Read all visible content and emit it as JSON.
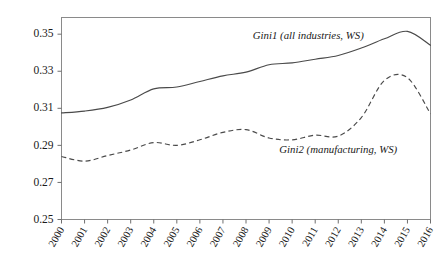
{
  "chart_data": {
    "type": "line",
    "title": "",
    "subtitle": "",
    "xlabel": "",
    "ylabel": "",
    "grid": false,
    "legend_position": "inline-annotation",
    "x": [
      2000,
      2001,
      2002,
      2003,
      2004,
      2005,
      2006,
      2007,
      2008,
      2009,
      2010,
      2011,
      2012,
      2013,
      2014,
      2015,
      2016
    ],
    "categories": [
      "2000",
      "2001",
      "2002",
      "2003",
      "2004",
      "2005",
      "2006",
      "2007",
      "2008",
      "2009",
      "2010",
      "2011",
      "2012",
      "2013",
      "2014",
      "2015",
      "2016"
    ],
    "xlim": [
      2000,
      2016
    ],
    "ylim": [
      0.25,
      0.359
    ],
    "yticks": [
      0.25,
      0.27,
      0.29,
      0.31,
      0.33,
      0.35
    ],
    "ytick_labels": [
      "0.25",
      "0.27",
      "0.29",
      "0.31",
      "0.33",
      "0.35"
    ],
    "series": [
      {
        "name": "Gini1 (all industries, WS)",
        "style": "solid",
        "color": "#4a4a4a",
        "annotation": "Gini1 (all industries, WS)",
        "values": [
          0.3075,
          0.3085,
          0.3105,
          0.3145,
          0.3205,
          0.3215,
          0.3245,
          0.3275,
          0.3295,
          0.3335,
          0.3345,
          0.3365,
          0.3385,
          0.3425,
          0.3475,
          0.3515,
          0.344
        ]
      },
      {
        "name": "Gini2 (manufacturing, WS)",
        "style": "dashed",
        "color": "#4a4a4a",
        "annotation": "Gini2 (manufacturing, WS)",
        "values": [
          0.284,
          0.2815,
          0.2845,
          0.2875,
          0.2915,
          0.29,
          0.293,
          0.297,
          0.2985,
          0.294,
          0.293,
          0.2955,
          0.295,
          0.305,
          0.325,
          0.3265,
          0.307
        ]
      }
    ],
    "annotations": [
      {
        "id": "gini1-label",
        "text": "Gini1 (all industries, WS)",
        "x": 2010.7,
        "y": 0.3475
      },
      {
        "id": "gini2-label",
        "text": "Gini2 (manufacturing, WS)",
        "x": 2012.0,
        "y": 0.286
      }
    ]
  }
}
